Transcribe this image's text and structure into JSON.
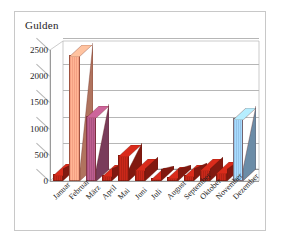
{
  "chart_data": {
    "type": "bar",
    "title": "Gulden",
    "xlabel": "",
    "ylabel": "Gulden",
    "ylim": [
      0,
      2500
    ],
    "yticks": [
      0,
      500,
      1000,
      1500,
      2000,
      2500
    ],
    "ytick_labels": [
      "0",
      "500",
      "1000",
      "1500",
      "2000",
      "2500"
    ],
    "grid": true,
    "legend": "none",
    "three_d": true,
    "categories": [
      "Januar",
      "Februar",
      "März",
      "April",
      "Mai",
      "Juni",
      "Juli",
      "August",
      "September",
      "Oktober",
      "November",
      "Dezember"
    ],
    "values": [
      130,
      2400,
      1250,
      110,
      490,
      230,
      60,
      75,
      110,
      230,
      175,
      1200
    ],
    "bar_colors": [
      "#b32316",
      "#f4a083",
      "#a8537f",
      "#b32316",
      "#b32316",
      "#b32316",
      "#b32316",
      "#b32316",
      "#b32316",
      "#b32316",
      "#b32316",
      "#95c3e8"
    ],
    "value_labels": []
  },
  "colors": {
    "bar_red": "#b32316",
    "bar_salmon": "#f4a083",
    "bar_purple": "#a8537f",
    "bar_blue": "#95c3e8",
    "gridline": "#b6b6b6",
    "axis": "#9a9a9a",
    "frame_border": "#c8c8c8",
    "text": "#1d1d1d",
    "background": "#ffffff"
  }
}
